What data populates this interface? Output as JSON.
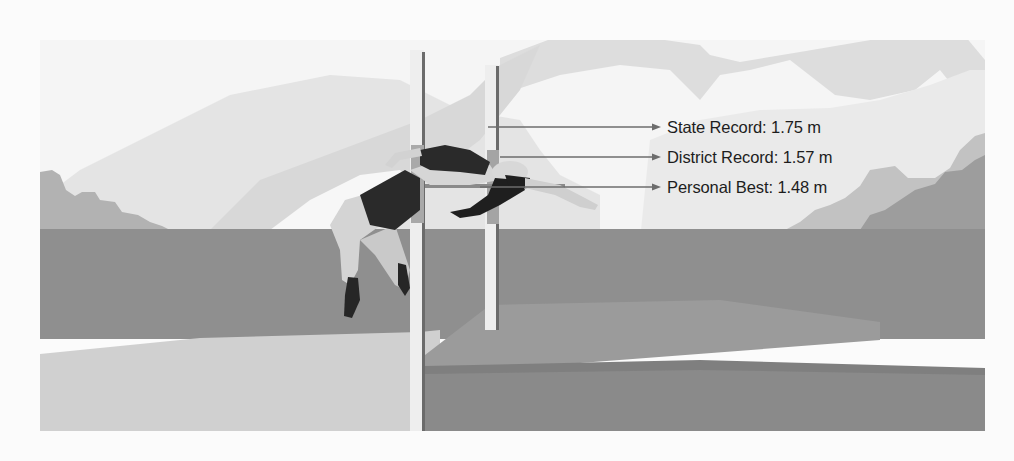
{
  "figure": {
    "annotations": [
      {
        "label": "State Record: 1.75 m",
        "name": "State Record",
        "value": "1.75",
        "unit": "m"
      },
      {
        "label": "District Record: 1.57 m",
        "name": "District Record",
        "value": "1.57",
        "unit": "m"
      },
      {
        "label": "Personal Best: 1.48 m",
        "name": "Personal Best",
        "value": "1.48",
        "unit": "m"
      }
    ]
  },
  "colors": {
    "background": "#fbfbfb",
    "sky": "#f4f4f4",
    "far_mountain": "#dcdcdc",
    "near_mountain": "#e6e6e6",
    "bush_light": "#b9b9b9",
    "bush_dark": "#9c9c9c",
    "track": "#8e8e8e",
    "sand": "#cfcfcf",
    "landing": "#959595",
    "landing_shadow": "#848484",
    "post": "#efefef",
    "post_line": "#6a6a6a",
    "bar": "#8a8a8a",
    "skin": "#d6d6d6",
    "suit": "#2b2b2b",
    "hair": "#1e1e1e",
    "arrow": "#6d6d6d",
    "text": "#1d1d1d"
  }
}
